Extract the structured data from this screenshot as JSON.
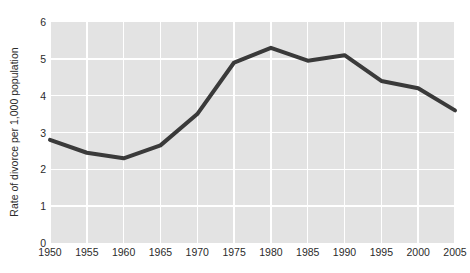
{
  "chart_data": {
    "type": "line",
    "title": "",
    "subtitle": "",
    "xlabel": "",
    "ylabel": "Rate of divorce per 1,000 population",
    "x": [
      1950,
      1955,
      1960,
      1965,
      1970,
      1975,
      1980,
      1985,
      1990,
      1995,
      2000,
      2005
    ],
    "categories": [
      "1950",
      "1955",
      "1960",
      "1965",
      "1970",
      "1975",
      "1980",
      "1985",
      "1990",
      "1995",
      "2000",
      "2005"
    ],
    "values": [
      2.8,
      2.45,
      2.3,
      2.65,
      3.5,
      4.9,
      5.3,
      4.95,
      5.1,
      4.4,
      4.2,
      3.6
    ],
    "series": [
      {
        "name": "Rate of divorce per 1,000 population",
        "values": [
          2.8,
          2.45,
          2.3,
          2.65,
          3.5,
          4.9,
          5.3,
          4.95,
          5.1,
          4.4,
          4.2,
          3.6
        ]
      }
    ],
    "xlim": [
      1950,
      2005
    ],
    "ylim": [
      0,
      6
    ],
    "y_ticks": [
      "0",
      "1",
      "2",
      "3",
      "4",
      "5",
      "6"
    ],
    "y_tick_values": [
      0,
      1,
      2,
      3,
      4,
      5,
      6
    ],
    "x_ticks": [
      "1950",
      "1955",
      "1960",
      "1965",
      "1970",
      "1975",
      "1980",
      "1985",
      "1990",
      "1995",
      "2000",
      "2005"
    ],
    "grid": true,
    "grid_color": "#ffffff",
    "legend": false,
    "legend_position": "none",
    "plot_background": "#e3e3e3",
    "page_background": "#ffffff",
    "line_color": "#3a3a3a",
    "line_width": 4,
    "text_color": "#2b2b2b",
    "annotations": []
  }
}
